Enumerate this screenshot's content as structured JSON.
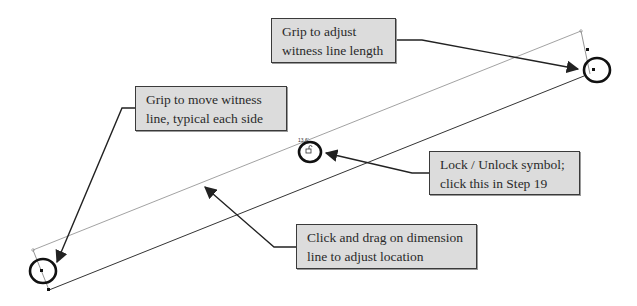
{
  "diagram": {
    "dimension_text": "13.6'",
    "callouts": [
      {
        "id": "witness-length",
        "lines": [
          "Grip to adjust",
          "witness line length"
        ]
      },
      {
        "id": "move-witness",
        "lines": [
          "Grip to move witness",
          "line, typical each side"
        ]
      },
      {
        "id": "lock-unlock",
        "lines": [
          "Lock / Unlock symbol;",
          "click this in Step 19"
        ]
      },
      {
        "id": "drag-dimension",
        "lines": [
          "Click and drag on dimension",
          "line to adjust location"
        ]
      }
    ],
    "icons": {
      "lock": "lock-unlock-icon",
      "grip": "grip-handle-icon"
    },
    "colors": {
      "callout_fill": "#dcdcdc",
      "callout_border": "#3a3a3a",
      "line": "#555555",
      "circle": "#111111"
    }
  }
}
